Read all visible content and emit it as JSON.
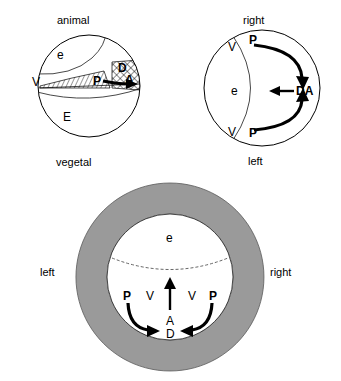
{
  "figure": {
    "title": "",
    "panels": [
      {
        "id": "panel-top-left",
        "name": "lateral-view-embryo",
        "labels": {
          "top": "animal",
          "bottom": "vegetal",
          "left": "V",
          "ectoderm": "e",
          "endoderm": "E",
          "organizer": "P",
          "dorsal": "D",
          "anterior": "A"
        }
      },
      {
        "id": "panel-top-right",
        "name": "animal-pole-view-embryo",
        "labels": {
          "top": "right",
          "bottom": "left",
          "ectoderm": "e",
          "ventral_upper": "V",
          "ventral_lower": "V",
          "posterior_upper": "P",
          "posterior_lower": "P",
          "dorsal_anterior": "DA"
        }
      },
      {
        "id": "panel-bottom",
        "name": "vegetal-pole-view-embryo",
        "labels": {
          "left": "left",
          "right": "right",
          "ectoderm": "e",
          "posterior_left": "P",
          "ventral_left": "V",
          "ventral_right": "V",
          "posterior_right": "P",
          "anterior": "A",
          "dorsal": "D"
        }
      }
    ],
    "colors": {
      "outline": "#000000",
      "ring_fill": "#9a9a9a",
      "background": "#ffffff",
      "arrow": "#000000"
    }
  }
}
